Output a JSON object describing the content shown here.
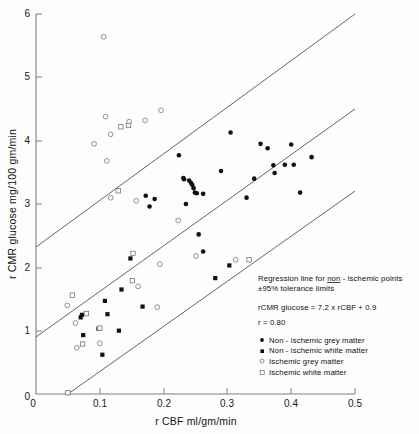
{
  "figure": {
    "background_color": "#fdfdfd",
    "ink_color": "#111111"
  },
  "chart_data": {
    "type": "scatter",
    "title": "",
    "xlabel": "r CBF   ml/gm/min",
    "ylabel": "r CMR glucose   mg/100 gm/min",
    "xlim": [
      0,
      0.5
    ],
    "ylim": [
      0,
      6
    ],
    "xticks": [
      "0",
      "0.1",
      "0.2",
      "0.3",
      "0.4",
      "0.5"
    ],
    "xtick_values": [
      0,
      0.1,
      0.2,
      0.3,
      0.4,
      0.5
    ],
    "yticks": [
      "0",
      "1",
      "2",
      "3",
      "4",
      "5",
      "6"
    ],
    "ytick_values": [
      0,
      1,
      2,
      3,
      4,
      5,
      6
    ],
    "grid": false,
    "legend_position": "lower-right",
    "regression": {
      "equation": "rCMR glucose = 7.2 x rCBF + 0.9",
      "slope": 7.2,
      "intercept": 0.9,
      "r": 0.8,
      "tolerance": "±95%"
    },
    "lines": [
      {
        "name": "upper-tolerance-limit",
        "x": [
          0.0,
          0.5
        ],
        "y": [
          2.32,
          6.0
        ]
      },
      {
        "name": "regression-line",
        "x": [
          0.0,
          0.5
        ],
        "y": [
          0.9,
          4.5
        ]
      },
      {
        "name": "lower-tolerance-limit",
        "x": [
          0.05,
          0.5
        ],
        "y": [
          0.0,
          3.2
        ]
      }
    ],
    "series": [
      {
        "name": "Non-ischemic grey matter",
        "marker": "filled-circle",
        "points": [
          [
            0.224,
            3.77
          ],
          [
            0.231,
            3.41
          ],
          [
            0.232,
            3.39
          ],
          [
            0.24,
            3.37
          ],
          [
            0.243,
            3.33
          ],
          [
            0.245,
            3.3
          ],
          [
            0.247,
            3.25
          ],
          [
            0.249,
            3.18
          ],
          [
            0.252,
            3.17
          ],
          [
            0.235,
            3.0
          ],
          [
            0.262,
            3.16
          ],
          [
            0.29,
            3.52
          ],
          [
            0.305,
            4.13
          ],
          [
            0.33,
            3.1
          ],
          [
            0.342,
            3.4
          ],
          [
            0.352,
            3.95
          ],
          [
            0.363,
            3.88
          ],
          [
            0.372,
            3.61
          ],
          [
            0.374,
            3.49
          ],
          [
            0.39,
            3.62
          ],
          [
            0.4,
            3.94
          ],
          [
            0.404,
            3.62
          ],
          [
            0.414,
            3.18
          ],
          [
            0.432,
            3.74
          ],
          [
            0.172,
            3.13
          ],
          [
            0.178,
            2.96
          ],
          [
            0.186,
            3.08
          ],
          [
            0.255,
            2.52
          ],
          [
            0.262,
            2.25
          ]
        ]
      },
      {
        "name": "Non-ischemic white matter",
        "marker": "filled-square",
        "points": [
          [
            0.148,
            2.14
          ],
          [
            0.134,
            1.65
          ],
          [
            0.167,
            1.38
          ],
          [
            0.108,
            1.47
          ],
          [
            0.112,
            1.26
          ],
          [
            0.13,
            1.0
          ],
          [
            0.072,
            1.25
          ],
          [
            0.07,
            1.21
          ],
          [
            0.074,
            0.93
          ],
          [
            0.098,
            1.03
          ],
          [
            0.104,
            0.62
          ],
          [
            0.05,
            0.02
          ],
          [
            0.281,
            1.83
          ],
          [
            0.303,
            2.03
          ]
        ]
      },
      {
        "name": "Ischemic grey matter",
        "marker": "open-circle",
        "points": [
          [
            0.106,
            5.64
          ],
          [
            0.196,
            4.48
          ],
          [
            0.109,
            4.38
          ],
          [
            0.146,
            4.3
          ],
          [
            0.171,
            4.32
          ],
          [
            0.117,
            4.1
          ],
          [
            0.091,
            3.95
          ],
          [
            0.111,
            3.68
          ],
          [
            0.117,
            3.1
          ],
          [
            0.157,
            3.05
          ],
          [
            0.223,
            2.74
          ],
          [
            0.194,
            2.05
          ],
          [
            0.251,
            2.18
          ],
          [
            0.313,
            2.12
          ],
          [
            0.16,
            1.7
          ],
          [
            0.19,
            1.37
          ],
          [
            0.064,
            0.73
          ],
          [
            0.1,
            0.8
          ],
          [
            0.049,
            1.4
          ],
          [
            0.062,
            1.12
          ]
        ]
      },
      {
        "name": "Ischemic white matter",
        "marker": "open-square",
        "points": [
          [
            0.133,
            4.22
          ],
          [
            0.145,
            4.24
          ],
          [
            0.129,
            3.21
          ],
          [
            0.152,
            2.22
          ],
          [
            0.151,
            1.79
          ],
          [
            0.057,
            1.56
          ],
          [
            0.079,
            1.27
          ],
          [
            0.1,
            1.04
          ],
          [
            0.073,
            0.79
          ],
          [
            0.05,
            0.02
          ],
          [
            0.334,
            2.12
          ]
        ]
      }
    ],
    "annotations": [
      "Regression line for non-ischemic points",
      "±95% tolerance limits",
      "rCMR glucose = 7.2 x rCBF + 0.9",
      "r = 0.80"
    ]
  },
  "annotation": {
    "line1_pre": "Regression  line  for  ",
    "line1_underlined": "non",
    "line1_post": " - ischemic  points",
    "line2": "±95%  tolerance  limits",
    "line3": "rCMR glucose = 7.2  x  rCBF + 0.9",
    "line4": "r = 0.80"
  },
  "legend": {
    "items": [
      {
        "label": "Non - ischemic  grey  matter",
        "marker": "filled-circle"
      },
      {
        "label": "Non - ischemic  white  matter",
        "marker": "filled-square"
      },
      {
        "label": "Ischemic  grey  matter",
        "marker": "open-circle"
      },
      {
        "label": "Ischemic  white  matter",
        "marker": "open-square"
      }
    ]
  },
  "axes": {
    "x_title": "r CBF   ml/gm/min",
    "y_title": "r CMR  glucose    mg/100 gm/min",
    "x_tick_labels": [
      "0",
      "0.1",
      "0.2",
      "0.3",
      "0.4",
      "0.5"
    ],
    "y_tick_labels": [
      "0",
      "1",
      "2",
      "3",
      "4",
      "5",
      "6"
    ]
  }
}
